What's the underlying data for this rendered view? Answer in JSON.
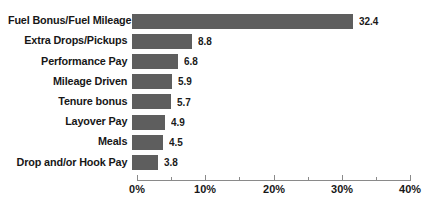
{
  "chart_data": {
    "type": "bar",
    "orientation": "horizontal",
    "title": "",
    "subtitle": "",
    "xlabel": "",
    "ylabel": "",
    "categories": [
      "Fuel Bonus/Fuel Mileage",
      "Extra Drops/Pickups",
      "Performance Pay",
      "Mileage Driven",
      "Tenure bonus",
      "Layover Pay",
      "Meals",
      "Drop and/or Hook Pay"
    ],
    "values": [
      32.4,
      8.8,
      6.8,
      5.9,
      5.7,
      4.9,
      4.5,
      3.8
    ],
    "value_labels": [
      "32.4",
      "8.8",
      "6.8",
      "5.9",
      "5.7",
      "4.9",
      "4.5",
      "3.8"
    ],
    "xlim": [
      0,
      40
    ],
    "xticks": [
      0,
      10,
      20,
      30,
      40
    ],
    "xtick_labels": [
      "0%",
      "10%",
      "20%",
      "30%",
      "40%"
    ],
    "xticks_minor": [
      5,
      15,
      25,
      35
    ],
    "grid": false,
    "legend": false,
    "bar_color": "#5e5e5e",
    "axis_color": "#8a8a8a",
    "text_color": "#171717",
    "background": "#ffffff"
  }
}
